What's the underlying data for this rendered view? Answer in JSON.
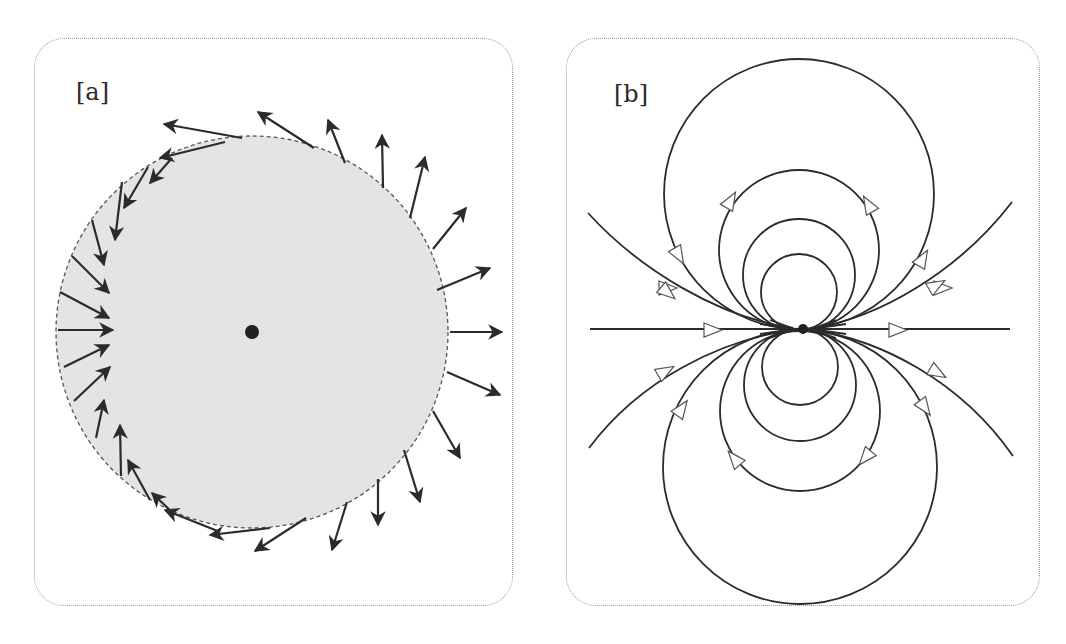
{
  "figure": {
    "panels": [
      {
        "id": "a",
        "label": "[a]",
        "description": "Shaded circle with a central point charge; vector arrows along the boundary point outward on the right side and inward on the left side",
        "circle": {
          "cx": 252,
          "cy": 332,
          "r": 196,
          "fill": "#e4e4e4",
          "stroke": "#555555",
          "dashed": true
        },
        "center_dot": {
          "cx": 252,
          "cy": 332,
          "r": 7,
          "color": "#222222"
        }
      },
      {
        "id": "b",
        "label": "[b]",
        "description": "Dipole field lines: nested circles tangent at the central point, with open arrowheads showing direction, plus open curves extending to the sides",
        "center_dot": {
          "cx": 803,
          "cy": 329,
          "r": 5,
          "color": "#222222"
        }
      }
    ],
    "colors": {
      "line": "#2b2b2b",
      "border": "#9a9a9a",
      "shade": "#e4e4e4"
    }
  }
}
